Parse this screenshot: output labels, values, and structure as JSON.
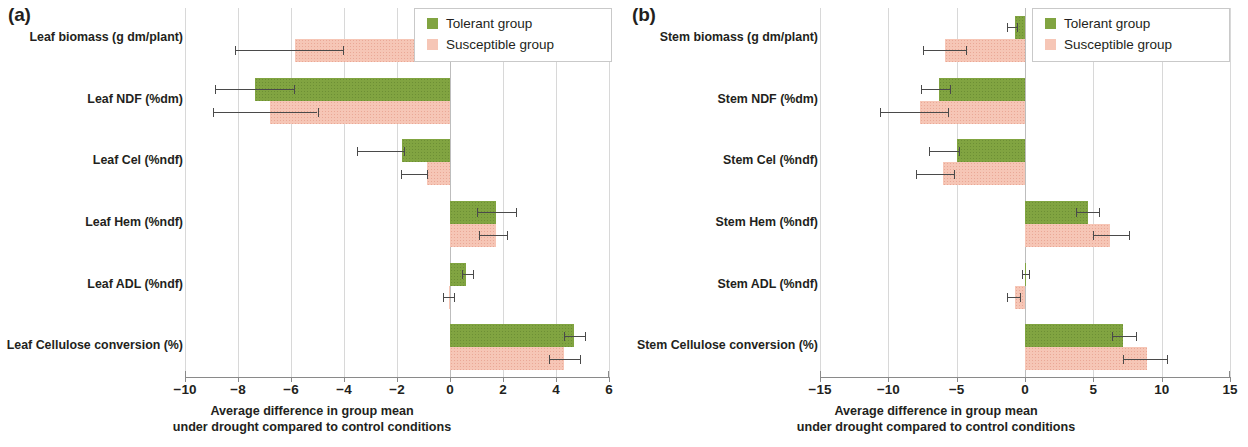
{
  "chart_data": [
    {
      "type": "bar",
      "panel": "(a)",
      "orientation": "horizontal",
      "title": "",
      "xlabel_line1": "Average difference in group mean",
      "xlabel_line2": "under drought compared to control conditions",
      "ylabel": "",
      "xlim": [
        -10,
        6
      ],
      "xticks": [
        -10,
        -8,
        -6,
        -4,
        -2,
        0,
        2,
        4,
        6
      ],
      "xticklabels": [
        "−10",
        "−8",
        "−6",
        "−4",
        "−2",
        "0",
        "2",
        "4",
        "6"
      ],
      "grid": true,
      "legend_position": "top-right",
      "categories": [
        "Leaf biomass (g dm/plant)",
        "Leaf NDF (%dm)",
        "Leaf Cel (%ndf)",
        "Leaf Hem (%ndf)",
        "Leaf ADL (%ndf)",
        "Leaf Cellulose conversion (%)"
      ],
      "series": [
        {
          "name": "Tolerant group",
          "color": "#81a441",
          "values": [
            0.15,
            -7.35,
            -1.8,
            1.75,
            0.6,
            4.68
          ],
          "err_low": [
            -0.55,
            -8.85,
            -3.5,
            1.0,
            0.45,
            4.3
          ],
          "err_high": [
            0.4,
            -5.9,
            -1.75,
            2.5,
            0.85,
            5.1
          ]
        },
        {
          "name": "Susceptible group",
          "color": "#f6c6b6",
          "values": [
            -5.85,
            -6.8,
            -0.87,
            1.72,
            -0.05,
            4.3
          ],
          "err_low": [
            -8.1,
            -8.95,
            -1.85,
            1.1,
            -0.25,
            3.75
          ],
          "err_high": [
            -4.05,
            -5.0,
            -0.85,
            2.15,
            0.15,
            4.9
          ]
        }
      ]
    },
    {
      "type": "bar",
      "panel": "(b)",
      "orientation": "horizontal",
      "title": "",
      "xlabel_line1": "Average difference in group mean",
      "xlabel_line2": "under drought compared to control conditions",
      "ylabel": "",
      "xlim": [
        -15,
        15
      ],
      "xticks": [
        -15,
        -10,
        -5,
        0,
        5,
        10,
        15
      ],
      "xticklabels": [
        "−15",
        "−10",
        "−5",
        "0",
        "5",
        "10",
        "15"
      ],
      "grid": true,
      "legend_position": "top-right",
      "categories": [
        "Stem biomass (g dm/plant)",
        "Stem NDF (%dm)",
        "Stem Cel (%ndf)",
        "Stem Hem (%ndf)",
        "Stem ADL (%ndf)",
        "Stem Cellulose conversion (%)"
      ],
      "series": [
        {
          "name": "Tolerant group",
          "color": "#81a441",
          "values": [
            -0.7,
            -6.3,
            -5.0,
            4.6,
            0.05,
            7.2
          ],
          "err_low": [
            -1.3,
            -7.6,
            -7.0,
            3.7,
            -0.25,
            6.4
          ],
          "err_high": [
            -0.6,
            -5.5,
            -4.8,
            5.4,
            0.3,
            8.1
          ]
        },
        {
          "name": "Susceptible group",
          "color": "#f6c6b6",
          "values": [
            -5.85,
            -7.7,
            -6.0,
            6.2,
            -0.7,
            8.95
          ],
          "err_low": [
            -7.5,
            -10.6,
            -8.0,
            5.0,
            -1.3,
            7.2
          ],
          "err_high": [
            -4.3,
            -5.6,
            -5.2,
            7.6,
            -0.35,
            10.4
          ]
        }
      ]
    }
  ],
  "panel_a": {
    "letter": "(a)",
    "legend": {
      "tolerant": "Tolerant group",
      "susceptible": "Susceptible group"
    },
    "axis_title_line1": "Average difference in group mean",
    "axis_title_line2": "under drought compared to control conditions"
  },
  "panel_b": {
    "letter": "(b)",
    "legend": {
      "tolerant": "Tolerant group",
      "susceptible": "Susceptible group"
    },
    "axis_title_line1": "Average difference in group mean",
    "axis_title_line2": "under drought compared to control conditions"
  }
}
